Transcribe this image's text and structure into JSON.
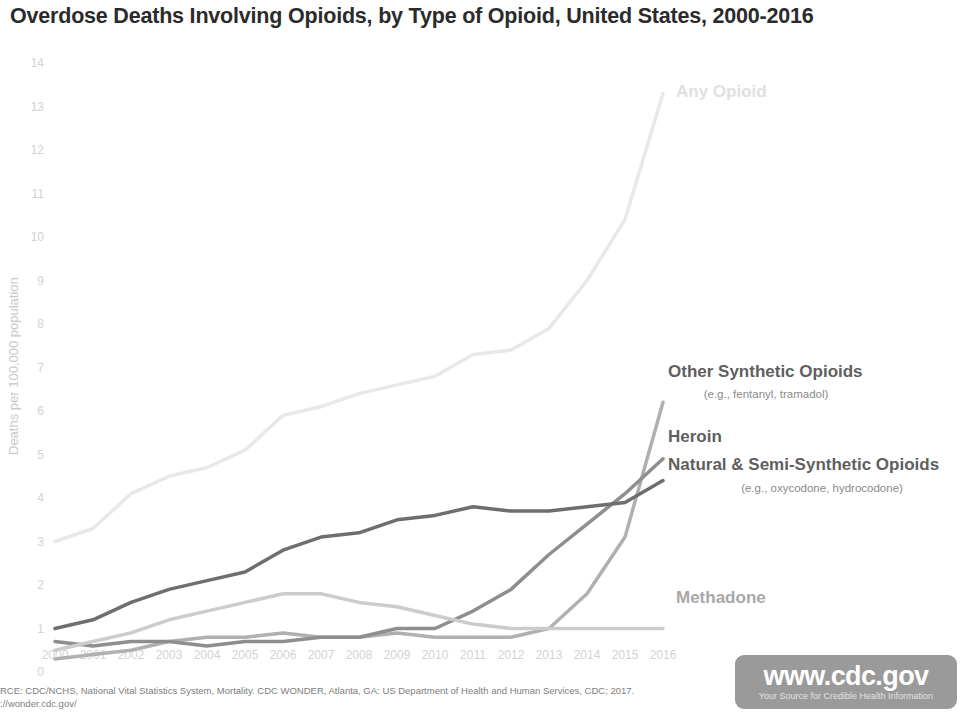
{
  "header": {
    "title": "Overdose Deaths Involving Opioids, by Type of Opioid, United States, 2000-2016"
  },
  "footer": {
    "source_line1": "RCE: CDC/NCHS, National Vital Statistics System, Mortality. CDC WONDER, Atlanta, GA: US Department of Health and Human Services, CDC; 2017.",
    "source_line2": "://wonder.cdc.gov/",
    "badge_url": "www.cdc.gov",
    "badge_tagline": "Your Source for Credible Health Information"
  },
  "chart_data": {
    "type": "line",
    "title": "Overdose Deaths Involving Opioids, by Type of Opioid, United States, 2000-2016",
    "xlabel": "",
    "ylabel": "Deaths per 100,000 population",
    "x": [
      2000,
      2001,
      2002,
      2003,
      2004,
      2005,
      2006,
      2007,
      2008,
      2009,
      2010,
      2011,
      2012,
      2013,
      2014,
      2015,
      2016
    ],
    "xtick_labels": [
      "2000",
      "2001",
      "2002",
      "2003",
      "2004",
      "2005",
      "2006",
      "2007",
      "2008",
      "2009",
      "2010",
      "2011",
      "2012",
      "2013",
      "2014",
      "2015",
      "2016"
    ],
    "ytick_labels": [
      "0",
      "1",
      "2",
      "3",
      "4",
      "5",
      "6",
      "7",
      "8",
      "9",
      "10",
      "11",
      "12",
      "13",
      "14"
    ],
    "xlim": [
      2000,
      2016
    ],
    "ylim": [
      0,
      14
    ],
    "grid": false,
    "legend": "inline-right",
    "series": [
      {
        "name": "Any Opioid",
        "sublabel": "",
        "color": "#e8e8e8",
        "label_color": "#e0e0e0",
        "values": [
          3.0,
          3.3,
          4.1,
          4.5,
          4.7,
          5.1,
          5.9,
          6.1,
          6.4,
          6.6,
          6.8,
          7.3,
          7.4,
          7.9,
          9.0,
          10.4,
          13.3
        ]
      },
      {
        "name": "Other Synthetic Opioids",
        "sublabel": "(e.g., fentanyl, tramadol)",
        "color": "#b0b0b0",
        "label_color": "#5f5f5f",
        "values": [
          0.3,
          0.4,
          0.5,
          0.7,
          0.8,
          0.8,
          0.9,
          0.8,
          0.8,
          0.9,
          0.8,
          0.8,
          0.8,
          1.0,
          1.8,
          3.1,
          6.2
        ]
      },
      {
        "name": "Heroin",
        "sublabel": "",
        "color": "#8e8e8e",
        "label_color": "#5f5f5f",
        "values": [
          0.7,
          0.6,
          0.7,
          0.7,
          0.6,
          0.7,
          0.7,
          0.8,
          0.8,
          1.0,
          1.0,
          1.4,
          1.9,
          2.7,
          3.4,
          4.1,
          4.9
        ]
      },
      {
        "name": "Natural & Semi-Synthetic Opioids",
        "sublabel": "(e.g., oxycodone, hydrocodone)",
        "color": "#6e6e6e",
        "label_color": "#5f5f5f",
        "values": [
          1.0,
          1.2,
          1.6,
          1.9,
          2.1,
          2.3,
          2.8,
          3.1,
          3.2,
          3.5,
          3.6,
          3.8,
          3.7,
          3.7,
          3.8,
          3.9,
          4.4
        ]
      },
      {
        "name": "Methadone",
        "sublabel": "",
        "color": "#cccccc",
        "label_color": "#a8a8a8",
        "values": [
          0.5,
          0.7,
          0.9,
          1.2,
          1.4,
          1.6,
          1.8,
          1.8,
          1.6,
          1.5,
          1.3,
          1.1,
          1.0,
          1.0,
          1.0,
          1.0,
          1.0
        ]
      }
    ]
  }
}
